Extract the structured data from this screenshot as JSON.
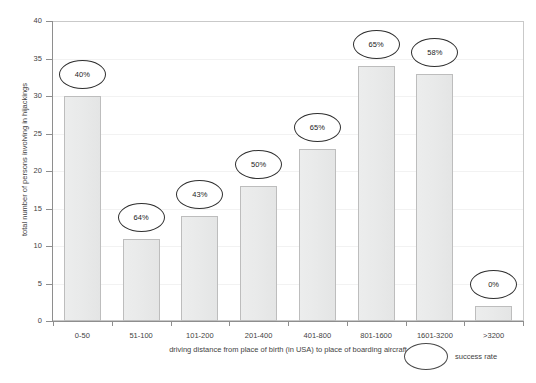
{
  "chart_data": {
    "type": "bar",
    "title": "",
    "categories": [
      "0-50",
      "51-100",
      "101-200",
      "201-400",
      "401-800",
      "801-1600",
      "1601-3200",
      ">3200"
    ],
    "values": [
      30,
      11,
      14,
      18,
      23,
      34,
      33,
      2
    ],
    "point_labels": [
      "40%",
      "64%",
      "43%",
      "50%",
      "65%",
      "65%",
      "58%",
      "0%"
    ],
    "xlabel": "driving distance from place of birth (in USA) to place of boarding aircraft",
    "ylabel": "total number of persons involving in hijackings",
    "ylim": [
      0,
      40
    ],
    "yticks": [
      0,
      5,
      10,
      15,
      20,
      25,
      30,
      35,
      40
    ],
    "ytick_labels": [
      "0",
      "5",
      "10",
      "15",
      "20",
      "25",
      "30",
      "35",
      "40"
    ],
    "grid": true,
    "legend": {
      "position": "bottom-right",
      "entries": [
        {
          "marker": "oval-callout",
          "label": "success rate"
        }
      ]
    },
    "colors": {
      "bar_fill": "#eaebeb",
      "bar_border": "#bdbdbd",
      "axis": "#8e8e8e",
      "gridline": "#f2f2f2",
      "callout_border": "#2f2f2f",
      "text": "#3f3f3f",
      "background": "#ffffff"
    }
  }
}
